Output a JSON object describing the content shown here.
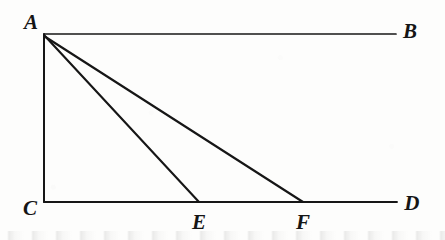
{
  "figure": {
    "type": "geometry-diagram",
    "width": 445,
    "height": 240,
    "background_color": "#fdfdfc",
    "stroke_color": "#161616",
    "label_color": "#151515",
    "points": [
      {
        "id": "A",
        "label": "A",
        "x": 44,
        "y": 34,
        "label_x": 31,
        "label_y": 22
      },
      {
        "id": "B",
        "label": "B",
        "x": 396,
        "y": 34,
        "label_x": 410,
        "label_y": 31
      },
      {
        "id": "C",
        "label": "C",
        "x": 44,
        "y": 202,
        "label_x": 30,
        "label_y": 208
      },
      {
        "id": "D",
        "label": "D",
        "x": 397,
        "y": 202,
        "label_x": 412,
        "label_y": 203
      },
      {
        "id": "E",
        "label": "E",
        "x": 199,
        "y": 202,
        "label_x": 199,
        "label_y": 222
      },
      {
        "id": "F",
        "label": "F",
        "x": 303,
        "y": 202,
        "label_x": 303,
        "label_y": 222
      }
    ],
    "segments": [
      {
        "id": "AB",
        "from": "A",
        "to": "B",
        "x1": 44,
        "y1": 34,
        "x2": 396,
        "y2": 34,
        "width": 1.7
      },
      {
        "id": "AC",
        "from": "A",
        "to": "C",
        "x1": 44,
        "y1": 34,
        "x2": 44,
        "y2": 202,
        "width": 2.0
      },
      {
        "id": "CD",
        "from": "C",
        "to": "D",
        "x1": 44,
        "y1": 202,
        "x2": 397,
        "y2": 202,
        "width": 1.9
      },
      {
        "id": "AE",
        "from": "A",
        "to": "E",
        "x1": 44,
        "y1": 35,
        "x2": 199,
        "y2": 202,
        "width": 2.1
      },
      {
        "id": "AF",
        "from": "A",
        "to": "F",
        "x1": 44,
        "y1": 36,
        "x2": 303,
        "y2": 202,
        "width": 2.1
      }
    ],
    "smudge": {
      "top": 231
    }
  }
}
